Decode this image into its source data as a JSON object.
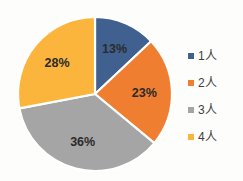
{
  "chart_data": {
    "type": "pie",
    "title": "",
    "subtitle": "",
    "xlabel": "",
    "ylabel": "",
    "grid": false,
    "legend_position": "right",
    "start_angle_deg": 0,
    "direction": "clockwise",
    "categories": [
      "1人",
      "2人",
      "3人",
      "4人"
    ],
    "values": [
      13,
      23,
      36,
      28
    ],
    "value_unit": "%",
    "data_labels": [
      "13%",
      "23%",
      "36%",
      "28%"
    ],
    "colors": [
      "#40618f",
      "#ef7e31",
      "#a5a5a5",
      "#fbb53c"
    ],
    "slices": [
      {
        "label": "1人",
        "value": 13,
        "data_label": "13%",
        "color": "#40618f"
      },
      {
        "label": "2人",
        "value": 23,
        "data_label": "23%",
        "color": "#ef7e31"
      },
      {
        "label": "3人",
        "value": 36,
        "data_label": "36%",
        "color": "#a5a5a5"
      },
      {
        "label": "4人",
        "value": 28,
        "data_label": "28%",
        "color": "#fbb53c"
      }
    ]
  },
  "legend": {
    "items": [
      {
        "label": "1人",
        "color": "#40618f",
        "marker": "square-marker-icon"
      },
      {
        "label": "2人",
        "color": "#ef7e31",
        "marker": "square-marker-icon"
      },
      {
        "label": "3人",
        "color": "#a5a5a5",
        "marker": "square-marker-icon"
      },
      {
        "label": "4人",
        "color": "#fbb53c",
        "marker": "square-marker-icon"
      }
    ]
  },
  "labels": {
    "slice_1": "13%",
    "slice_2": "23%",
    "slice_3": "36%",
    "slice_4": "28%"
  }
}
